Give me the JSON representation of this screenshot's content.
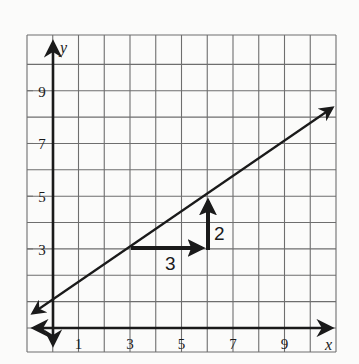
{
  "chart_data": {
    "type": "line",
    "title": "",
    "xlabel": "x",
    "ylabel": "y",
    "xlim": [
      -1,
      11
    ],
    "ylim": [
      -1,
      11
    ],
    "grid": true,
    "x_tick_labels": [
      "1",
      "3",
      "5",
      "7",
      "9"
    ],
    "x_tick_values": [
      1,
      3,
      5,
      7,
      9
    ],
    "y_tick_labels": [
      "3",
      "5",
      "7",
      "9"
    ],
    "y_tick_values": [
      3,
      5,
      7,
      9
    ],
    "line": {
      "equation": "y = (2/3)x + 1",
      "slope": 0.6667,
      "intercept": 1,
      "points": [
        [
          3,
          3
        ],
        [
          6,
          5
        ]
      ],
      "arrows_both_ends": true
    },
    "annotations": [
      {
        "type": "run-arrow",
        "from": [
          3,
          3
        ],
        "to": [
          6,
          3
        ],
        "label": "3"
      },
      {
        "type": "rise-arrow",
        "from": [
          6,
          3
        ],
        "to": [
          6,
          5
        ],
        "label": "2"
      }
    ]
  },
  "labels": {
    "x_axis": "x",
    "y_axis": "y",
    "run": "3",
    "rise": "2"
  }
}
